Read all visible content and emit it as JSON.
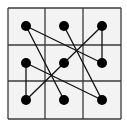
{
  "diagram": {
    "type": "grid-dot-connection-puzzle",
    "grid": {
      "rows": 3,
      "cols": 3,
      "x_lines": [
        8,
        45,
        83,
        121
      ],
      "y_lines": [
        8,
        45,
        81,
        119
      ],
      "cell_fill": "#f3f3f3",
      "line_color": "#3a3a3a",
      "line_width": 1.3
    },
    "dots": [
      {
        "id": "top-left",
        "row": 0,
        "col": 0,
        "x": 26,
        "y": 26
      },
      {
        "id": "top-center",
        "row": 0,
        "col": 1,
        "x": 64,
        "y": 26
      },
      {
        "id": "top-right",
        "row": 0,
        "col": 2,
        "x": 102,
        "y": 26
      },
      {
        "id": "middle-left",
        "row": 1,
        "col": 0,
        "x": 26,
        "y": 63
      },
      {
        "id": "middle-center",
        "row": 1,
        "col": 1,
        "x": 64,
        "y": 63
      },
      {
        "id": "middle-right",
        "row": 1,
        "col": 2,
        "x": 102,
        "y": 63
      },
      {
        "id": "bottom-left",
        "row": 2,
        "col": 0,
        "x": 26,
        "y": 100
      },
      {
        "id": "bottom-center",
        "row": 2,
        "col": 1,
        "x": 64,
        "y": 100
      },
      {
        "id": "bottom-right",
        "row": 2,
        "col": 2,
        "x": 102,
        "y": 100
      }
    ],
    "dot_radius": 5,
    "dot_color": "#000000",
    "connections": [
      {
        "from": "top-left",
        "to": "bottom-center"
      },
      {
        "from": "top-left",
        "to": "middle-right"
      },
      {
        "from": "top-center",
        "to": "bottom-right"
      },
      {
        "from": "top-right",
        "to": "middle-right"
      },
      {
        "from": "top-right",
        "to": "middle-center"
      },
      {
        "from": "middle-center",
        "to": "bottom-left"
      },
      {
        "from": "middle-left",
        "to": "bottom-left"
      },
      {
        "from": "middle-left",
        "to": "bottom-right"
      }
    ],
    "connection_color": "#111111",
    "connection_width": 1.3
  }
}
